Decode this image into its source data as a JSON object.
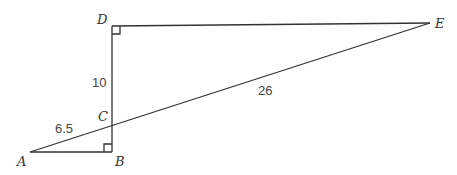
{
  "diagram": {
    "points": {
      "A": {
        "label": "A",
        "x": 30,
        "y": 152
      },
      "B": {
        "label": "B",
        "x": 112,
        "y": 152
      },
      "C": {
        "label": "C",
        "x": 112,
        "y": 125
      },
      "D": {
        "label": "D",
        "x": 112,
        "y": 26
      },
      "E": {
        "label": "E",
        "x": 430,
        "y": 23
      }
    },
    "segments": [
      {
        "from": "A",
        "to": "B"
      },
      {
        "from": "B",
        "to": "D"
      },
      {
        "from": "D",
        "to": "E"
      },
      {
        "from": "A",
        "to": "E"
      }
    ],
    "right_angles": [
      "B",
      "D"
    ],
    "measures": {
      "CD": "10",
      "AC": "6.5",
      "CE": "26"
    },
    "colors": {
      "line": "#333333",
      "text": "#444444"
    }
  }
}
